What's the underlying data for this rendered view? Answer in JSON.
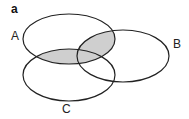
{
  "panel_label": "a",
  "sets": [
    {
      "name": "A",
      "label": "A"
    },
    {
      "name": "B",
      "label": "B"
    },
    {
      "name": "C",
      "label": "C"
    }
  ],
  "shaded_region": "A ∩ (B ∪ C)",
  "colors": {
    "shade": "#cfcfcf",
    "stroke": "#222222"
  }
}
